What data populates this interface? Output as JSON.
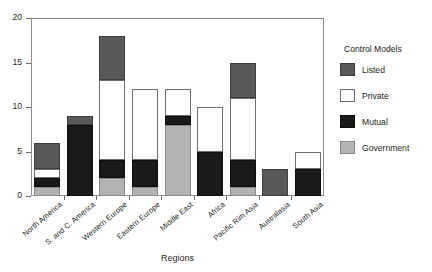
{
  "chart_data": {
    "type": "bar",
    "subtype": "stacked-vertical",
    "title": "",
    "xlabel": "Regions",
    "ylabel": "",
    "ylim": [
      0,
      20
    ],
    "yticks": [
      0,
      5,
      10,
      15,
      20
    ],
    "grid": true,
    "legend_position": "right",
    "legend_title": "Control Models",
    "categories": [
      "North America",
      "S. and C. America",
      "Western Europe",
      "Eastern Europe",
      "Middle East",
      "Africa",
      "Pacific Rim Asia",
      "Australasia",
      "South Asia"
    ],
    "series": [
      {
        "name": "Government",
        "color": "#b3b3b3",
        "values": [
          1,
          0,
          2,
          1,
          8,
          0,
          1,
          0,
          0
        ]
      },
      {
        "name": "Mutual",
        "color": "#1a1a1a",
        "values": [
          1,
          8,
          2,
          3,
          1,
          5,
          3,
          0,
          3
        ]
      },
      {
        "name": "Private",
        "color": "#ffffff",
        "values": [
          1,
          0,
          9,
          8,
          3,
          5,
          7,
          0,
          2
        ]
      },
      {
        "name": "Listed",
        "color": "#585858",
        "values": [
          3,
          1,
          5,
          0,
          0,
          0,
          4,
          3,
          0
        ]
      }
    ],
    "totals": [
      6,
      9,
      18,
      12,
      12,
      10,
      15,
      3,
      5
    ]
  },
  "legend": {
    "title": "Control Models",
    "items": [
      {
        "label": "Listed",
        "key": "listed"
      },
      {
        "label": "Private",
        "key": "private"
      },
      {
        "label": "Mutual",
        "key": "mutual"
      },
      {
        "label": "Government",
        "key": "government"
      }
    ]
  },
  "axes": {
    "y_tick_labels": [
      "0",
      "5",
      "10",
      "15",
      "20"
    ],
    "x_title": "Regions"
  }
}
